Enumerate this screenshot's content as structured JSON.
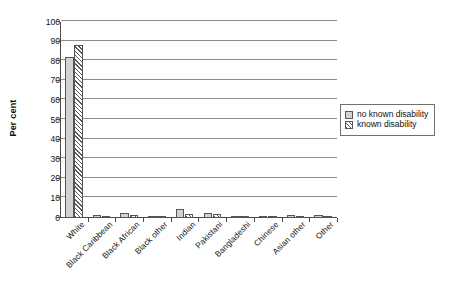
{
  "chart_data": {
    "type": "bar",
    "title": "",
    "subtitle": "",
    "xlabel": "",
    "ylabel": "Per cent",
    "ylim": [
      0,
      100
    ],
    "y_ticks": [
      0,
      10,
      20,
      30,
      40,
      50,
      60,
      70,
      80,
      90,
      100
    ],
    "grid": "horizontal",
    "legend_position": "right",
    "categories": [
      "White",
      "Black Caribbean",
      "Black African",
      "Black other",
      "Indian",
      "Pakistani",
      "Bangladeshi",
      "Chinese",
      "Asian other",
      "Other"
    ],
    "series": [
      {
        "name": "no known disability",
        "pattern": "solid-light-grey",
        "color": "#d2d2d2",
        "values": [
          82.0,
          1.3,
          2.6,
          1.0,
          4.6,
          2.6,
          0.9,
          1.1,
          1.4,
          1.7
        ]
      },
      {
        "name": "known disability",
        "pattern": "diagonal-hatch",
        "color": "#5a5a5a",
        "values": [
          88.5,
          1.0,
          1.6,
          0.8,
          2.2,
          1.9,
          0.6,
          0.6,
          0.8,
          1.2
        ]
      }
    ]
  },
  "legend": {
    "entries": [
      {
        "label": "no known disability"
      },
      {
        "label": "known disability"
      }
    ]
  },
  "axis": {
    "y_title": "Per cent"
  }
}
